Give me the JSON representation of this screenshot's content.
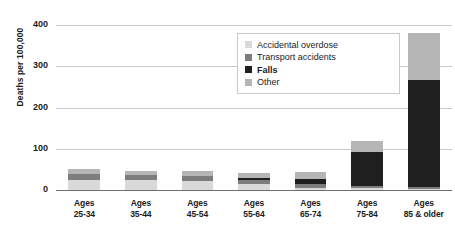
{
  "chart_data": {
    "type": "bar",
    "stacked": true,
    "title": "",
    "xlabel": "",
    "ylabel": "Deaths per 100,000",
    "ylim": [
      0,
      400
    ],
    "yticks": [
      0,
      100,
      200,
      300,
      400
    ],
    "ytick_labels": [
      "0",
      "100",
      "200",
      "300",
      "400"
    ],
    "grid": true,
    "legend_position": "upper center",
    "categories": [
      "Ages 25-34",
      "Ages 35-44",
      "Ages 45-54",
      "Ages 55-64",
      "Ages 65-74",
      "Ages 75-84",
      "Ages 85 & older"
    ],
    "category_lines": [
      [
        "Ages",
        "25-34"
      ],
      [
        "Ages",
        "35-44"
      ],
      [
        "Ages",
        "45-54"
      ],
      [
        "Ages",
        "55-64"
      ],
      [
        "Ages",
        "65-74"
      ],
      [
        "Ages",
        "75-84"
      ],
      [
        "Ages",
        "85 & older"
      ]
    ],
    "series": [
      {
        "name": "Accidental overdose",
        "color": "#d9d9d9",
        "values": [
          25,
          24,
          22,
          15,
          6,
          4,
          3
        ]
      },
      {
        "name": "Transport accidents",
        "color": "#7c7c7c",
        "values": [
          13,
          12,
          11,
          10,
          9,
          6,
          5
        ]
      },
      {
        "name": "Falls",
        "color": "#1f1f1f",
        "values": [
          1,
          1,
          2,
          4,
          11,
          82,
          258
        ]
      },
      {
        "name": "Other",
        "color": "#b5b5b5",
        "values": [
          11,
          10,
          11,
          12,
          17,
          26,
          114
        ]
      }
    ],
    "totals": [
      50,
      47,
      46,
      41,
      43,
      118,
      380
    ]
  },
  "legend": {
    "items": [
      {
        "label": "Accidental overdose",
        "color": "#d9d9d9",
        "bold": false
      },
      {
        "label": "Transport accidents",
        "color": "#7c7c7c",
        "bold": false
      },
      {
        "label": "Falls",
        "color": "#1f1f1f",
        "bold": true
      },
      {
        "label": "Other",
        "color": "#b5b5b5",
        "bold": false
      }
    ]
  },
  "colors": {
    "gridline": "#c9c9c9",
    "baseline": "#6f6f6f",
    "text": "#1b1b1b",
    "background": "#ffffff"
  }
}
